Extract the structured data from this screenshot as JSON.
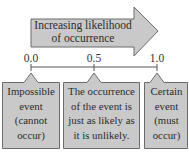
{
  "arrow": {
    "label_line1": "Increasing likelihood",
    "label_line2": "of occurrence",
    "fill": "#c9c9c9",
    "stroke": "#6b6b6b"
  },
  "scale": {
    "ticks": [
      {
        "value": "0.0",
        "x": 31
      },
      {
        "value": "0.5",
        "x": 94
      },
      {
        "value": "1.0",
        "x": 157
      }
    ]
  },
  "callouts": [
    {
      "lines": [
        "Impossible",
        "event",
        "(cannot",
        "occur)"
      ]
    },
    {
      "lines": [
        "The occurrence",
        "of the event is",
        "just as likely as",
        "it is unlikely."
      ]
    },
    {
      "lines": [
        "Certain",
        "event",
        "(must",
        "occur)"
      ]
    }
  ],
  "caption": ""
}
